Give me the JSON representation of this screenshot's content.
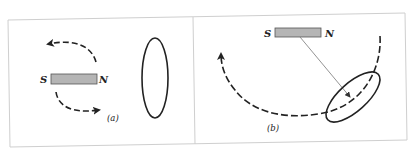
{
  "figure": {
    "panels": [
      {
        "id": "a",
        "caption": "(a)",
        "magnet": {
          "south_label": "S",
          "north_label": "N"
        },
        "description": "Bar magnet with dashed rotation arrows (upper arrow pointing left, lower arrow pointing right) beside a vertical wire loop"
      },
      {
        "id": "b",
        "caption": "(b)",
        "magnet": {
          "south_label": "S",
          "north_label": "N"
        },
        "description": "Bar magnet above a tilted wire loop, thin line from magnet to loop center with arrowhead, large dashed arc with arrow pointing up-left"
      }
    ],
    "colors": {
      "magnet_fill": "#b5b5b5",
      "magnet_stroke": "#555555",
      "line": "#222222",
      "frame": "#cfcfcf",
      "background": "#ffffff"
    }
  }
}
